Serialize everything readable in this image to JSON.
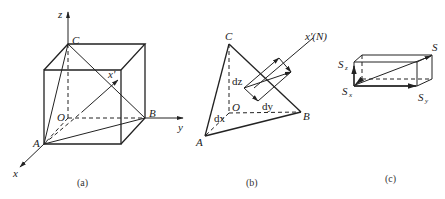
{
  "figure": {
    "panel_a": {
      "caption": "(a)",
      "labels": {
        "z": "z",
        "y": "y",
        "x": "x",
        "C": "C",
        "B": "B",
        "A": "A",
        "O": "O",
        "x_prime": "x'"
      }
    },
    "panel_b": {
      "caption": "(b)",
      "labels": {
        "C": "C",
        "B": "B",
        "A": "A",
        "O": "O",
        "dz": "dz",
        "dy": "dy",
        "dx": "dx",
        "x_prime_N": "x'(N)"
      }
    },
    "panel_c": {
      "caption": "(c)",
      "labels": {
        "S": "S",
        "Sz_main": "S",
        "Sz_sub": "z",
        "Sx_main": "S",
        "Sx_sub": "x",
        "Sy_main": "S",
        "Sy_sub": "y"
      }
    }
  }
}
